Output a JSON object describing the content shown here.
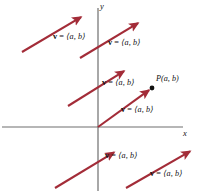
{
  "figure": {
    "background_color": "#ffffff",
    "width": 207,
    "height": 191,
    "colors": {
      "vector": "#A32C38",
      "axis": "#6E6E6E",
      "point": "#111111",
      "text": "#111111"
    },
    "axes": {
      "x_label": "x",
      "y_label": "y",
      "origin": {
        "x": 98,
        "y": 127
      },
      "x_axis": {
        "x1": 2,
        "y1": 127,
        "x2": 183,
        "y2": 127
      },
      "y_axis": {
        "x1": 98,
        "y1": 8,
        "x2": 98,
        "y2": 191
      }
    },
    "point": {
      "name": "P(a, b)",
      "label_parts": {
        "p": "P",
        "coords": "(a, b)"
      },
      "x": 152,
      "y": 88
    },
    "vector_label": {
      "symbol": "v",
      "equals": " = ",
      "components": "⟨a, b⟩",
      "full": "v = ⟨a, b⟩"
    },
    "vectors": [
      {
        "id": "vector-1",
        "name": "vector-upper-left",
        "tail": {
          "x": 22,
          "y": 52
        },
        "head": {
          "x": 83,
          "y": 16
        },
        "label_pos": {
          "x": 53,
          "y": 37
        }
      },
      {
        "id": "vector-2",
        "name": "vector-upper-right",
        "tail": {
          "x": 80,
          "y": 58
        },
        "head": {
          "x": 140,
          "y": 22
        },
        "label_pos": {
          "x": 108,
          "y": 43
        }
      },
      {
        "id": "vector-3",
        "name": "vector-middle",
        "tail": {
          "x": 68,
          "y": 106
        },
        "head": {
          "x": 126,
          "y": 70
        },
        "label_pos": {
          "x": 102,
          "y": 79
        }
      },
      {
        "id": "vector-4",
        "name": "vector-position-from-origin",
        "tail": {
          "x": 98,
          "y": 127
        },
        "head": {
          "x": 151,
          "y": 89
        },
        "label_pos": {
          "x": 121,
          "y": 107
        }
      },
      {
        "id": "vector-5",
        "name": "vector-lower-left",
        "tail": {
          "x": 55,
          "y": 188
        },
        "head": {
          "x": 116,
          "y": 151
        },
        "label_pos": {
          "x": 105,
          "y": 152
        }
      },
      {
        "id": "vector-6",
        "name": "vector-lower-right",
        "tail": {
          "x": 126,
          "y": 188
        },
        "head": {
          "x": 192,
          "y": 150
        },
        "label_pos": {
          "x": 150,
          "y": 170
        }
      }
    ]
  }
}
